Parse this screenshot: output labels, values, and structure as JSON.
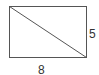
{
  "diagram": {
    "shape": "rectangle",
    "has_diagonal": true,
    "width_label": "8",
    "height_label": "5",
    "stroke_color": "#555555"
  }
}
